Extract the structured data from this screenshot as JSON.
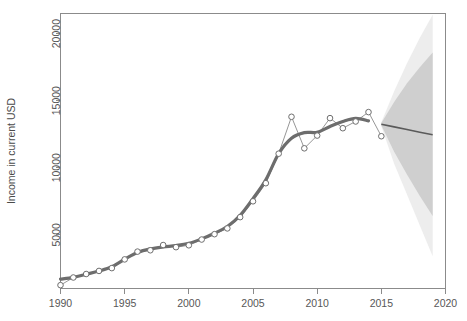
{
  "chart_data": {
    "type": "line",
    "title": "",
    "xlabel": "",
    "ylabel": "Income in current USD",
    "xlim": [
      1990,
      2020
    ],
    "ylim": [
      1000,
      21500
    ],
    "grid": false,
    "legend": "none",
    "xticks": [
      "1990",
      "1995",
      "2000",
      "2005",
      "2010",
      "2015",
      "2020"
    ],
    "xtick_values": [
      1990,
      1995,
      2000,
      2005,
      2010,
      2015,
      2020
    ],
    "yticks": [
      "5000",
      "10000",
      "15000",
      "20000"
    ],
    "ytick_values": [
      5000,
      10000,
      15000,
      20000
    ],
    "series": [
      {
        "name": "Observed income",
        "style": "thin-line-with-open-circles",
        "x": [
          1990,
          1991,
          1992,
          1993,
          1994,
          1995,
          1996,
          1997,
          1998,
          1999,
          2000,
          2001,
          2002,
          2003,
          2004,
          2005,
          2006,
          2007,
          2008,
          2009,
          2010,
          2011,
          2012,
          2013,
          2014,
          2015
        ],
        "values": [
          1250,
          1820,
          2080,
          2310,
          2520,
          3170,
          3750,
          3850,
          4240,
          4080,
          4220,
          4650,
          5050,
          5480,
          6320,
          7500,
          8850,
          11050,
          13800,
          11450,
          12400,
          13700,
          12950,
          13450,
          14150,
          12350
        ]
      },
      {
        "name": "Smoothed trend",
        "style": "thick-line",
        "x": [
          1990,
          1991,
          1992,
          1993,
          1994,
          1995,
          1996,
          1997,
          1998,
          1999,
          2000,
          2001,
          2002,
          2003,
          2004,
          2005,
          2006,
          2007,
          2008,
          2009,
          2010,
          2011,
          2012,
          2013,
          2014
        ],
        "values": [
          1700,
          1830,
          2060,
          2300,
          2620,
          3180,
          3680,
          3950,
          4100,
          4200,
          4370,
          4700,
          5120,
          5620,
          6450,
          7700,
          9100,
          11050,
          12200,
          12620,
          12650,
          13080,
          13450,
          13680,
          13500
        ]
      },
      {
        "name": "Forecast mean",
        "style": "thin-line",
        "x": [
          2015,
          2016,
          2017,
          2018,
          2019
        ],
        "values": [
          13250,
          13050,
          12850,
          12650,
          12460
        ]
      }
    ],
    "bands": [
      {
        "name": "outer-prediction-interval",
        "color": "#ededed",
        "x": [
          2015,
          2016,
          2017,
          2018,
          2019
        ],
        "upper": [
          13400,
          15700,
          17800,
          19700,
          21400
        ],
        "lower": [
          13100,
          10300,
          8000,
          5700,
          3400
        ]
      },
      {
        "name": "inner-prediction-interval",
        "color": "#cfcfcf",
        "x": [
          2015,
          2016,
          2017,
          2018,
          2019
        ],
        "upper": [
          13330,
          14900,
          16300,
          17500,
          18600
        ],
        "lower": [
          13170,
          11200,
          9500,
          7900,
          6400
        ]
      }
    ]
  }
}
